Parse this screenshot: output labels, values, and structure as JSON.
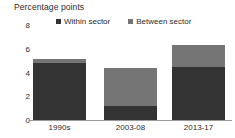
{
  "chart_data": {
    "type": "bar",
    "title": "Percentage points",
    "subtitle": "",
    "xlabel": "",
    "ylabel": "Percentage points",
    "stacked": true,
    "grid": false,
    "legend_position": "top",
    "categories": [
      "1990s",
      "2003-08",
      "2013-17"
    ],
    "ylim": [
      0,
      8
    ],
    "yticks": [
      0,
      2,
      4,
      6,
      8
    ],
    "ytick_labels": [
      "0",
      "2",
      "4",
      "6",
      "8"
    ],
    "series": [
      {
        "name": "Within sector",
        "values": [
          4.8,
          1.2,
          4.5
        ],
        "color": "#333333"
      },
      {
        "name": "Between sector",
        "values": [
          0.3,
          3.2,
          1.8
        ],
        "color": "#757575"
      }
    ],
    "totals": [
      5.1,
      4.4,
      6.3
    ]
  },
  "colors": {
    "within_sector": "#333333",
    "between_sector": "#757575",
    "axis": "#9a9a9a",
    "text": "#2b2b2b",
    "background": "#ffffff"
  }
}
